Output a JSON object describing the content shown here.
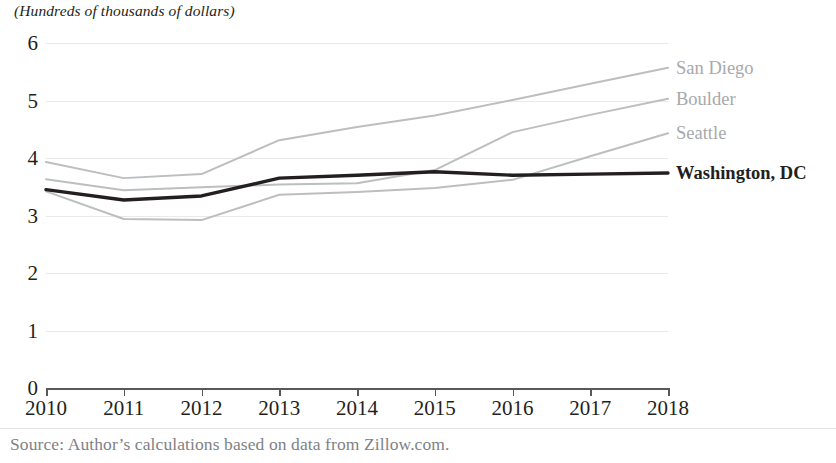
{
  "chart_data": {
    "type": "line",
    "title": "",
    "subtitle": "(Hundreds of thousands of dollars)",
    "xlabel": "",
    "ylabel": "",
    "x": [
      2010,
      2011,
      2012,
      2013,
      2014,
      2015,
      2016,
      2017,
      2018
    ],
    "xlim": [
      2010,
      2018
    ],
    "ylim": [
      0,
      6
    ],
    "y_ticks": [
      0,
      1,
      2,
      3,
      4,
      5,
      6
    ],
    "x_ticks": [
      "2010",
      "2011",
      "2012",
      "2013",
      "2014",
      "2015",
      "2016",
      "2017",
      "2018"
    ],
    "grid": true,
    "legend_position": "right-inline-end-of-line",
    "series": [
      {
        "name": "San Diego",
        "color": "#bcbec0",
        "emphasis": false,
        "values": [
          3.93,
          3.65,
          3.72,
          4.31,
          4.54,
          4.74,
          5.01,
          5.29,
          5.57
        ]
      },
      {
        "name": "Boulder",
        "color": "#bcbec0",
        "emphasis": false,
        "values": [
          3.63,
          3.44,
          3.49,
          3.54,
          3.56,
          3.79,
          4.45,
          4.75,
          5.03
        ]
      },
      {
        "name": "Seattle",
        "color": "#bcbec0",
        "emphasis": false,
        "values": [
          3.42,
          2.94,
          2.92,
          3.36,
          3.41,
          3.48,
          3.62,
          4.03,
          4.43
        ]
      },
      {
        "name": "Washington, DC",
        "color": "#231f20",
        "emphasis": true,
        "values": [
          3.45,
          3.27,
          3.34,
          3.65,
          3.7,
          3.76,
          3.7,
          3.72,
          3.74
        ]
      }
    ],
    "source_note": "Source: Author’s calculations based on data from Zillow.com."
  }
}
